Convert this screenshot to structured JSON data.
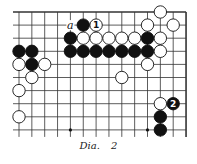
{
  "diagram": {
    "caption": "Dia.  2",
    "grid": {
      "cols": 14,
      "rows": 10,
      "x0": 19,
      "dx": 12.85,
      "y0": 12,
      "dy": 13.1,
      "open_edges": [
        "left",
        "bottom"
      ],
      "closed_edges": [
        "top",
        "right"
      ],
      "star_points": [
        [
          4,
          9
        ],
        [
          10,
          9
        ]
      ]
    },
    "colors": {
      "line": "#333333",
      "black": "#111111",
      "white": "#ffffff"
    },
    "stones": [
      {
        "col": 11,
        "row": 0,
        "color": "white"
      },
      {
        "col": 5,
        "row": 1,
        "color": "black"
      },
      {
        "col": 6,
        "row": 1,
        "color": "white",
        "label": "1"
      },
      {
        "col": 10,
        "row": 1,
        "color": "white"
      },
      {
        "col": 12,
        "row": 1,
        "color": "white"
      },
      {
        "col": 4,
        "row": 2,
        "color": "black"
      },
      {
        "col": 5,
        "row": 2,
        "color": "white"
      },
      {
        "col": 6,
        "row": 2,
        "color": "white"
      },
      {
        "col": 7,
        "row": 2,
        "color": "white"
      },
      {
        "col": 8,
        "row": 2,
        "color": "white"
      },
      {
        "col": 9,
        "row": 2,
        "color": "white"
      },
      {
        "col": 10,
        "row": 2,
        "color": "black"
      },
      {
        "col": 11,
        "row": 2,
        "color": "white"
      },
      {
        "col": 0,
        "row": 3,
        "color": "black"
      },
      {
        "col": 1,
        "row": 3,
        "color": "black"
      },
      {
        "col": 4,
        "row": 3,
        "color": "black"
      },
      {
        "col": 5,
        "row": 3,
        "color": "black"
      },
      {
        "col": 6,
        "row": 3,
        "color": "black"
      },
      {
        "col": 7,
        "row": 3,
        "color": "black"
      },
      {
        "col": 8,
        "row": 3,
        "color": "black"
      },
      {
        "col": 9,
        "row": 3,
        "color": "black"
      },
      {
        "col": 10,
        "row": 3,
        "color": "black"
      },
      {
        "col": 11,
        "row": 3,
        "color": "white"
      },
      {
        "col": 0,
        "row": 4,
        "color": "white"
      },
      {
        "col": 1,
        "row": 4,
        "color": "black"
      },
      {
        "col": 2,
        "row": 4,
        "color": "white"
      },
      {
        "col": 10,
        "row": 4,
        "color": "white"
      },
      {
        "col": 1,
        "row": 5,
        "color": "white"
      },
      {
        "col": 8,
        "row": 5,
        "color": "white"
      },
      {
        "col": 0,
        "row": 6,
        "color": "white"
      },
      {
        "col": 11,
        "row": 7,
        "color": "white"
      },
      {
        "col": 12,
        "row": 7,
        "color": "black",
        "label": "2"
      },
      {
        "col": 0,
        "row": 8,
        "color": "white"
      },
      {
        "col": 11,
        "row": 8,
        "color": "black"
      },
      {
        "col": 11,
        "row": 9,
        "color": "black"
      }
    ],
    "marks": [
      {
        "col": 4,
        "row": 1,
        "label": "a"
      }
    ]
  }
}
